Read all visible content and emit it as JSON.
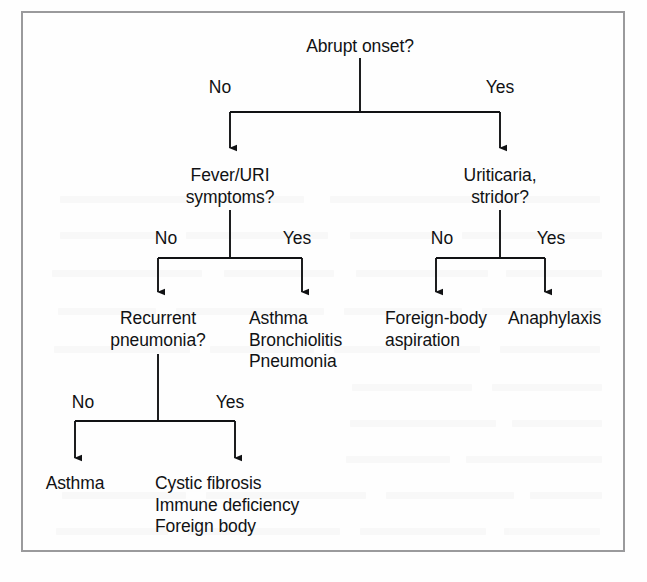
{
  "figure": {
    "kind": "clinical-decision-flowchart",
    "border_color": "#9a9a9c",
    "line_color": "#111214",
    "text_color": "#111214",
    "background": "#fefefe"
  },
  "nodes": {
    "root": {
      "label": "Abrupt onset?"
    },
    "fever_uri": {
      "label": "Fever/URI\nsymptoms?"
    },
    "uriticaria": {
      "label": "Uriticaria,\nstridor?"
    },
    "recurrent_pneumonia": {
      "label": "Recurrent\npneumonia?"
    },
    "asthma_bronchiolitis_pneumonia": {
      "label": "Asthma\nBronchiolitis\nPneumonia"
    },
    "foreign_body_aspiration": {
      "label": "Foreign-body\naspiration"
    },
    "anaphylaxis": {
      "label": "Anaphylaxis"
    },
    "asthma": {
      "label": "Asthma"
    },
    "cystic_fibrosis_group": {
      "label": "Cystic fibrosis\nImmune deficiency\nForeign body"
    }
  },
  "edge_labels": {
    "root_no": "No",
    "root_yes": "Yes",
    "fever_no": "No",
    "fever_yes": "Yes",
    "urticaria_no": "No",
    "urticaria_yes": "Yes",
    "pneumonia_no": "No",
    "pneumonia_yes": "Yes"
  }
}
